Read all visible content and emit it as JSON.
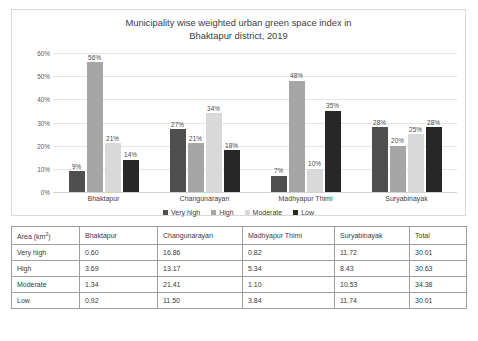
{
  "chart_data": {
    "type": "bar",
    "title": "Municipality wise weighted urban green space index in Bhaktapur district, 2019",
    "title_line1": "Municipality wise weighted urban green space index in",
    "title_line2": "Bhaktapur district, 2019",
    "xlabel": "",
    "ylabel": "",
    "ylim": [
      0,
      60
    ],
    "yticks": [
      "0%",
      "10%",
      "20%",
      "30%",
      "40%",
      "50%",
      "60%"
    ],
    "ytick_values": [
      0,
      10,
      20,
      30,
      40,
      50,
      60
    ],
    "grid": true,
    "legend_position": "bottom",
    "categories": [
      "Bhaktapur",
      "Changunarayan",
      "Madhyapur Thimi",
      "Suryabinayak"
    ],
    "series": [
      {
        "name": "Very high",
        "color": "#4f4f4f",
        "values": [
          9,
          27,
          7,
          28
        ],
        "labels": [
          "9%",
          "27%",
          "7%",
          "28%"
        ]
      },
      {
        "name": "High",
        "color": "#a6a6a6",
        "values": [
          56,
          21,
          48,
          20
        ],
        "labels": [
          "56%",
          "21%",
          "48%",
          "20%"
        ]
      },
      {
        "name": "Moderate",
        "color": "#d9d9d9",
        "values": [
          21,
          34,
          10,
          25
        ],
        "labels": [
          "21%",
          "34%",
          "10%",
          "25%"
        ]
      },
      {
        "name": "Low",
        "color": "#272727",
        "values": [
          14,
          18,
          35,
          28
        ],
        "labels": [
          "14%",
          "18%",
          "35%",
          "28%"
        ]
      }
    ]
  },
  "table": {
    "headers": [
      "Area (km2)",
      "Bhaktapur",
      "Changunarayan",
      "Madhyapur Thimi",
      "Suryabinayak",
      "Total"
    ],
    "header_first_base": "Area (km",
    "header_first_sup": "2",
    "header_first_tail": ")",
    "rows": [
      {
        "label": "Very high",
        "cells": [
          "0.60",
          "16.86",
          "0.82",
          "11.72",
          "30.01"
        ]
      },
      {
        "label": "High",
        "cells": [
          "3.69",
          "13.17",
          "5.34",
          "8.43",
          "30.63"
        ]
      },
      {
        "label": "Moderate",
        "cells": [
          "1.34",
          "21.41",
          "1.10",
          "10.53",
          "34.38"
        ]
      },
      {
        "label": "Low",
        "cells": [
          "0.92",
          "11.50",
          "3.84",
          "11.74",
          "30.01"
        ]
      }
    ]
  }
}
